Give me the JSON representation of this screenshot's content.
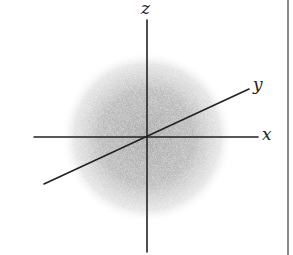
{
  "figure": {
    "axes": {
      "x": {
        "label": "x",
        "from": [
          34,
          137
        ],
        "to": [
          258,
          137
        ]
      },
      "y": {
        "label": "y",
        "from": [
          44,
          184
        ],
        "to": [
          249,
          89
        ]
      },
      "z": {
        "label": "z",
        "from": [
          147,
          20
        ],
        "to": [
          147,
          252
        ]
      }
    },
    "origin": [
      147,
      137
    ],
    "cloud": {
      "center": [
        147,
        137
      ],
      "radius": 86,
      "color": "#9a9a9a"
    },
    "axis_color": "#222222",
    "border_color": "#8a8a8a"
  }
}
